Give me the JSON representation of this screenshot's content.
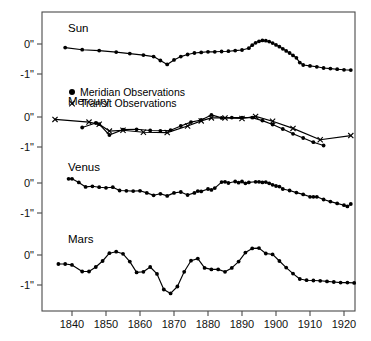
{
  "chart_data": {
    "type": "line",
    "title": "",
    "subtitle": "",
    "xlabel": "",
    "ylabel": "",
    "grid": false,
    "legend_position": "inside-upper-left",
    "xlim": [
      1834,
      1924
    ],
    "xticks": [
      1840,
      1850,
      1860,
      1870,
      1880,
      1890,
      1900,
      1910,
      1920
    ],
    "xtick_labels": [
      "1840",
      "1850",
      "1860",
      "1870",
      "1880",
      "1890",
      "1900",
      "1910",
      "1920"
    ],
    "panel_ylim": [
      0.55,
      -1.75
    ],
    "panel_yticks": [
      0,
      -1
    ],
    "panel_ytick_labels": [
      "0\"",
      "-1\""
    ],
    "legend": [
      {
        "marker": "filled-circle",
        "label": "Meridian Observations"
      },
      {
        "marker": "cross",
        "label": "Transit Observations"
      }
    ],
    "panels": [
      {
        "name": "Sun",
        "label": "Sun",
        "ytick_labels": [
          "0\"",
          "-1\""
        ],
        "series": [
          {
            "name": "Sun residuals",
            "marker": "filled-circle",
            "x": [
              1838,
              1843,
              1848,
              1853,
              1857,
              1861,
              1864,
              1866,
              1868,
              1870,
              1872,
              1874,
              1876,
              1878,
              1880,
              1882,
              1884,
              1886,
              1888,
              1890,
              1892,
              1893,
              1894,
              1895,
              1896,
              1897,
              1898,
              1899,
              1900,
              1901,
              1902,
              1903,
              1904,
              1905,
              1906,
              1907,
              1908,
              1910,
              1912,
              1914,
              1916,
              1918,
              1920,
              1922
            ],
            "y": [
              -0.12,
              -0.19,
              -0.22,
              -0.27,
              -0.32,
              -0.37,
              -0.42,
              -0.55,
              -0.68,
              -0.53,
              -0.42,
              -0.35,
              -0.3,
              -0.28,
              -0.26,
              -0.26,
              -0.25,
              -0.24,
              -0.22,
              -0.2,
              -0.14,
              -0.04,
              0.04,
              0.09,
              0.12,
              0.11,
              0.08,
              0.03,
              -0.03,
              -0.09,
              -0.16,
              -0.23,
              -0.3,
              -0.38,
              -0.46,
              -0.62,
              -0.7,
              -0.73,
              -0.76,
              -0.8,
              -0.82,
              -0.84,
              -0.86,
              -0.87
            ]
          }
        ]
      },
      {
        "name": "Mercury",
        "label": "Mercury",
        "ytick_labels": [
          "0\"",
          "-1\""
        ],
        "series": [
          {
            "name": "Meridian Observations",
            "marker": "filled-circle",
            "x": [
              1843,
              1847,
              1848,
              1851,
              1855,
              1859,
              1863,
              1866,
              1869,
              1872,
              1875,
              1878,
              1881,
              1884,
              1887,
              1890,
              1893,
              1896,
              1899,
              1902,
              1905,
              1908,
              1911,
              1914
            ],
            "y": [
              -0.35,
              -0.2,
              -0.24,
              -0.6,
              -0.42,
              -0.41,
              -0.45,
              -0.46,
              -0.44,
              -0.3,
              -0.17,
              -0.1,
              0.07,
              -0.03,
              -0.02,
              -0.02,
              -0.02,
              -0.12,
              -0.25,
              -0.4,
              -0.56,
              -0.7,
              -0.84,
              -0.95
            ]
          },
          {
            "name": "Transit Observations",
            "marker": "cross",
            "x": [
              1835,
              1845,
              1848,
              1851,
              1855,
              1861,
              1868,
              1874,
              1878,
              1881,
              1885,
              1890,
              1894,
              1899,
              1905,
              1913,
              1922
            ],
            "y": [
              -0.08,
              -0.17,
              -0.24,
              -0.47,
              -0.44,
              -0.51,
              -0.52,
              -0.3,
              -0.13,
              -0.03,
              -0.03,
              -0.05,
              0.02,
              -0.14,
              -0.38,
              -0.76,
              -0.62
            ]
          }
        ]
      },
      {
        "name": "Venus",
        "label": "Venus",
        "ytick_labels": [
          "0\"",
          "-1\""
        ],
        "series": [
          {
            "name": "Venus residuals",
            "marker": "filled-circle",
            "x": [
              1839,
              1840,
              1842,
              1844,
              1846,
              1848,
              1850,
              1852,
              1854,
              1856,
              1858,
              1860,
              1862,
              1864,
              1866,
              1868,
              1870,
              1872,
              1874,
              1876,
              1877,
              1878,
              1880,
              1881,
              1882,
              1884,
              1885,
              1886,
              1888,
              1889,
              1890,
              1891,
              1892,
              1894,
              1895,
              1896,
              1897,
              1898,
              1899,
              1900,
              1901,
              1902,
              1904,
              1906,
              1908,
              1910,
              1911,
              1912,
              1914,
              1916,
              1918,
              1920,
              1921,
              1922
            ],
            "y": [
              0.14,
              0.14,
              0.02,
              -0.13,
              -0.11,
              -0.14,
              -0.16,
              -0.14,
              -0.25,
              -0.26,
              -0.27,
              -0.26,
              -0.33,
              -0.41,
              -0.36,
              -0.43,
              -0.33,
              -0.3,
              -0.4,
              -0.33,
              -0.27,
              -0.28,
              -0.2,
              -0.23,
              -0.17,
              0.03,
              0.04,
              0.0,
              0.05,
              0.01,
              0.05,
              -0.01,
              0.02,
              0.04,
              0.04,
              0.02,
              0.03,
              -0.01,
              -0.06,
              -0.1,
              -0.12,
              -0.2,
              -0.25,
              -0.32,
              -0.38,
              -0.46,
              -0.46,
              -0.46,
              -0.55,
              -0.62,
              -0.68,
              -0.74,
              -0.78,
              -0.7
            ]
          }
        ]
      },
      {
        "name": "Mars",
        "label": "Mars",
        "ytick_labels": [
          "0\"",
          "-1\""
        ],
        "series": [
          {
            "name": "Mars residuals",
            "marker": "filled-circle",
            "x": [
              1836,
              1838,
              1840,
              1843,
              1845,
              1847,
              1849,
              1851,
              1853,
              1855,
              1857,
              1859,
              1861,
              1863,
              1865,
              1867,
              1869,
              1871,
              1873,
              1875,
              1877,
              1879,
              1881,
              1883,
              1885,
              1887,
              1889,
              1891,
              1893,
              1895,
              1897,
              1899,
              1901,
              1903,
              1905,
              1907,
              1909,
              1911,
              1913,
              1915,
              1917,
              1919,
              1921,
              1923
            ],
            "y": [
              -0.3,
              -0.3,
              -0.33,
              -0.55,
              -0.55,
              -0.4,
              -0.2,
              0.06,
              0.11,
              0.04,
              -0.22,
              -0.58,
              -0.56,
              -0.4,
              -0.63,
              -1.15,
              -1.28,
              -1.05,
              -0.56,
              -0.19,
              -0.12,
              -0.43,
              -0.48,
              -0.48,
              -0.56,
              -0.43,
              -0.22,
              0.08,
              0.22,
              0.23,
              0.05,
              0.02,
              -0.2,
              -0.42,
              -0.62,
              -0.8,
              -0.84,
              -0.85,
              -0.86,
              -0.88,
              -0.9,
              -0.92,
              -0.92,
              -0.93
            ]
          }
        ]
      }
    ]
  }
}
